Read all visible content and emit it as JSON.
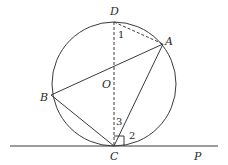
{
  "diagram": {
    "type": "geometry",
    "circle": {
      "center_label": "O",
      "cx": 114,
      "cy": 84,
      "r": 62
    },
    "points": {
      "D": {
        "label": "D",
        "x": 114,
        "y": 22
      },
      "A": {
        "label": "A",
        "x": 163,
        "y": 44
      },
      "B": {
        "label": "B",
        "x": 51,
        "y": 95
      },
      "C": {
        "label": "C",
        "x": 114,
        "y": 146
      },
      "O": {
        "label": "O",
        "x": 114,
        "y": 84
      },
      "P": {
        "label": "P",
        "x": 198,
        "y": 146
      }
    },
    "segments": [
      {
        "name": "AB",
        "style": "solid"
      },
      {
        "name": "BC",
        "style": "solid"
      },
      {
        "name": "AC",
        "style": "solid"
      },
      {
        "name": "DC",
        "style": "dashed"
      },
      {
        "name": "DA",
        "style": "dashed"
      },
      {
        "name": "tangent-line-CP",
        "style": "solid"
      }
    ],
    "angle_labels": {
      "angle1": "1",
      "angle2": "2",
      "angle3": "3"
    },
    "right_angle_marker": {
      "at": "C",
      "between": "DC and CP"
    }
  }
}
